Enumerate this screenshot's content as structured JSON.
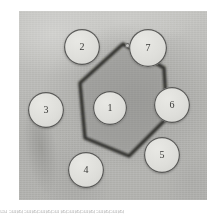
{
  "figure": {
    "type": "immunodiffusion-plate-micrograph",
    "panel": {
      "left": 19,
      "top": 11,
      "width": 188,
      "height": 189,
      "background_color": "#b9b9b6",
      "description": "Grayscale gel diffusion plate"
    },
    "precipitin_line": {
      "name": "hexagonal-precipitin-line",
      "color": "#2e2e2c",
      "shape": "hexagon",
      "points": "104,33 145,57 148,107 110,145 66,127 61,72",
      "stroke_width": 3.4
    },
    "wells": [
      {
        "id": "1",
        "label": "1",
        "cx": 91,
        "cy": 97,
        "r": 17,
        "has_tab": false
      },
      {
        "id": "2",
        "label": "2",
        "cx": 63,
        "cy": 36,
        "r": 18,
        "has_tab": false
      },
      {
        "id": "3",
        "label": "3",
        "cx": 27,
        "cy": 99,
        "r": 18,
        "has_tab": false
      },
      {
        "id": "4",
        "label": "4",
        "cx": 67,
        "cy": 159,
        "r": 18,
        "has_tab": false
      },
      {
        "id": "5",
        "label": "5",
        "cx": 143,
        "cy": 144,
        "r": 18,
        "has_tab": false
      },
      {
        "id": "6",
        "label": "6",
        "cx": 153,
        "cy": 94,
        "r": 18,
        "has_tab": false
      },
      {
        "id": "7",
        "label": "7",
        "cx": 129,
        "cy": 37,
        "r": 19,
        "has_tab": true
      }
    ],
    "colors": {
      "well_fill": "#dededa",
      "well_outline": "#3c3c3a",
      "gel_light": "#c9c9c6",
      "gel_dark": "#a8a8a5",
      "label_text": "#3a3a38"
    }
  },
  "caption": {
    "text": "图    细菌细菌细菌细菌细菌细菌细菌细菌"
  }
}
